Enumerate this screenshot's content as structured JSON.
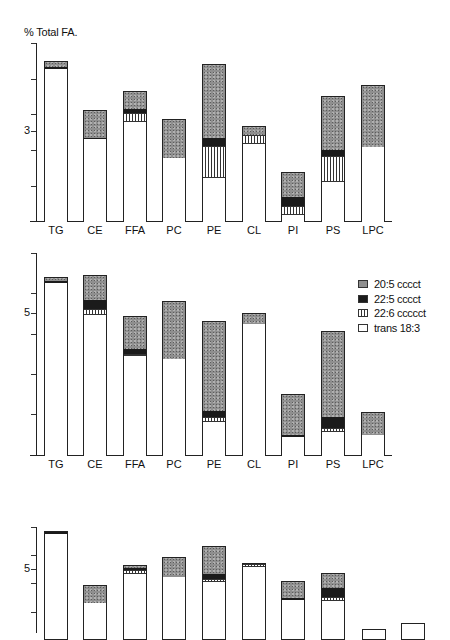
{
  "figure": {
    "ylabel": "% Total FA.",
    "legend": [
      {
        "key": "s205",
        "label": "20:5 cccct",
        "color": "#8f8f8f",
        "pattern": "stipple"
      },
      {
        "key": "s225",
        "label": "22:5 cccct",
        "color": "#1b1b1b",
        "pattern": "solid"
      },
      {
        "key": "s226",
        "label": "22:6 ccccct",
        "color": "#ffffff",
        "pattern": "vertical-lines"
      },
      {
        "key": "trans",
        "label": "trans 18:3",
        "color": "#ffffff",
        "pattern": "empty"
      }
    ]
  },
  "chart_data": [
    {
      "type": "bar",
      "stacked": true,
      "title": "",
      "ylabel": "% Total FA.",
      "xlabel": "",
      "y_tick_labels": [
        "3"
      ],
      "categories": [
        "TG",
        "CE",
        "FFA",
        "PC",
        "PE",
        "CL",
        "PI",
        "PS",
        "LPC"
      ],
      "series": [
        {
          "name": "trans 18:3",
          "values": [
            5.1,
            2.77,
            3.33,
            2.13,
            1.47,
            2.6,
            0.23,
            1.33,
            2.5
          ]
        },
        {
          "name": "22:6 ccccct",
          "values": [
            0,
            0,
            0.3,
            0,
            1.07,
            0.3,
            0.3,
            0.87,
            0
          ]
        },
        {
          "name": "22:5 cccct",
          "values": [
            0.07,
            0.03,
            0.13,
            0,
            0.27,
            0,
            0.3,
            0.2,
            0
          ]
        },
        {
          "name": "20:5 cccct",
          "values": [
            0.17,
            0.9,
            0.57,
            1.27,
            2.43,
            0.27,
            0.8,
            1.77,
            2.03
          ]
        }
      ],
      "ylim": [
        0,
        6
      ],
      "grid": false,
      "layout": {
        "axis_x": 36,
        "axis_top": 43,
        "baseline": 221,
        "ticks_y": [
          43,
          79,
          114,
          131,
          150,
          186
        ],
        "label_tick_y": 131,
        "px_per_unit": 30,
        "bar_x": [
          44,
          83,
          123,
          162,
          202,
          242,
          281,
          321,
          361
        ]
      }
    },
    {
      "type": "bar",
      "stacked": true,
      "title": "",
      "ylabel": "",
      "xlabel": "",
      "y_tick_labels": [
        "5"
      ],
      "categories": [
        "TG",
        "CE",
        "FFA",
        "PC",
        "PE",
        "CL",
        "PI",
        "PS",
        "LPC"
      ],
      "series": [
        {
          "name": "trans 18:3",
          "values": [
            6.09,
            4.96,
            3.52,
            3.42,
            1.2,
            4.65,
            0.67,
            0.85,
            0.74
          ]
        },
        {
          "name": "22:6 ccccct",
          "values": [
            0,
            0.21,
            0.07,
            0,
            0.18,
            0,
            0,
            0.14,
            0
          ]
        },
        {
          "name": "22:5 cccct",
          "values": [
            0.07,
            0.32,
            0.18,
            0,
            0.21,
            0,
            0.07,
            0.39,
            0
          ]
        },
        {
          "name": "20:5 cccct",
          "values": [
            0.11,
            0.85,
            1.13,
            2.01,
            3.13,
            0.35,
            1.41,
            2.99,
            0.77
          ]
        }
      ],
      "ylim": [
        0,
        7
      ],
      "grid": false,
      "legend_position": "upper right",
      "layout": {
        "axis_x": 36,
        "axis_top": 253,
        "baseline": 455,
        "ticks_y": [
          253,
          293,
          313,
          334,
          374,
          414
        ],
        "label_tick_y": 313,
        "px_per_unit": 28.4,
        "bar_x": [
          44,
          83,
          123,
          162,
          202,
          242,
          281,
          321,
          361
        ]
      }
    },
    {
      "type": "bar",
      "stacked": true,
      "title": "",
      "ylabel": "",
      "xlabel": "",
      "note": "Panel is cropped at the bottom edge; values estimated using tick '5' at y=569 and ~14px per unit.",
      "y_tick_labels": [
        "5"
      ],
      "categories": [
        "TG",
        "CE",
        "FFA",
        "PC",
        "PE",
        "CL",
        "PI",
        "PS",
        "LPC",
        "(unlabeled)"
      ],
      "series": [
        {
          "name": "20:5 cccct",
          "values": [
            0,
            1.2,
            0.15,
            1.35,
            1.9,
            0,
            1.15,
            1.0,
            0,
            0
          ]
        },
        {
          "name": "22:5 cccct",
          "values": [
            0.15,
            0,
            0.15,
            0,
            0.4,
            0,
            0.1,
            0.65,
            0,
            0
          ]
        },
        {
          "name": "22:6 ccccct",
          "values": [
            0,
            0,
            0.3,
            0,
            0.2,
            0.2,
            0,
            0.3,
            0,
            0
          ]
        }
      ],
      "bar_tops_y": [
        531,
        585,
        565,
        557,
        546,
        563,
        581,
        573,
        629,
        623
      ],
      "segments_px": [
        [
          {
            "k": "s225",
            "from": 531,
            "to": 533
          },
          {
            "k": "trans",
            "from": 533,
            "to": 633
          }
        ],
        [
          {
            "k": "s205",
            "from": 585,
            "to": 602
          },
          {
            "k": "trans",
            "from": 602,
            "to": 633
          }
        ],
        [
          {
            "k": "s205",
            "from": 565,
            "to": 567
          },
          {
            "k": "s225",
            "from": 567,
            "to": 569
          },
          {
            "k": "s226",
            "from": 569,
            "to": 573
          },
          {
            "k": "trans",
            "from": 573,
            "to": 633
          }
        ],
        [
          {
            "k": "s205",
            "from": 557,
            "to": 576
          },
          {
            "k": "trans",
            "from": 576,
            "to": 633
          }
        ],
        [
          {
            "k": "s205",
            "from": 546,
            "to": 573
          },
          {
            "k": "s225",
            "from": 573,
            "to": 578
          },
          {
            "k": "s226",
            "from": 578,
            "to": 581
          },
          {
            "k": "trans",
            "from": 581,
            "to": 633
          }
        ],
        [
          {
            "k": "s226",
            "from": 563,
            "to": 566
          },
          {
            "k": "trans",
            "from": 566,
            "to": 633
          }
        ],
        [
          {
            "k": "s205",
            "from": 581,
            "to": 597
          },
          {
            "k": "s225",
            "from": 597,
            "to": 599
          },
          {
            "k": "trans",
            "from": 599,
            "to": 633
          }
        ],
        [
          {
            "k": "s205",
            "from": 573,
            "to": 587
          },
          {
            "k": "s225",
            "from": 587,
            "to": 596
          },
          {
            "k": "s226",
            "from": 596,
            "to": 600
          },
          {
            "k": "trans",
            "from": 600,
            "to": 633
          }
        ],
        [
          {
            "k": "trans",
            "from": 629,
            "to": 633
          }
        ],
        [
          {
            "k": "trans",
            "from": 623,
            "to": 633
          }
        ]
      ],
      "layout": {
        "axis_x": 36,
        "axis_top": 527,
        "ticks_y": [
          527,
          555,
          569,
          583,
          612
        ],
        "label_tick_y": 569,
        "bar_x": [
          44,
          83,
          123,
          162,
          202,
          242,
          281,
          321,
          362,
          401
        ]
      }
    }
  ]
}
